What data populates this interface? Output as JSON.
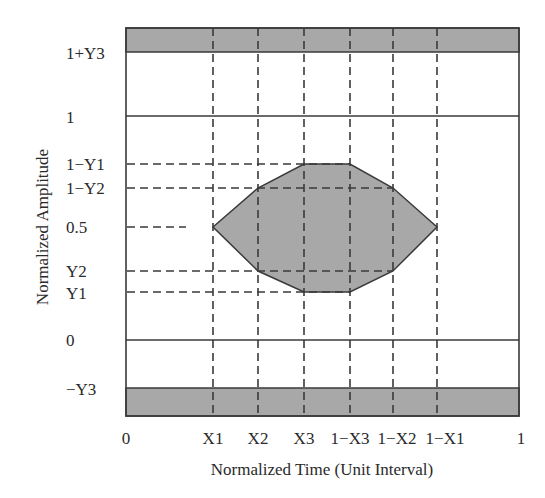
{
  "diagram": {
    "type": "eye-mask",
    "xlabel": "Normalized Time (Unit Interval)",
    "ylabel": "Normalized Amplitude",
    "x_ticks": [
      {
        "label": "0",
        "x": 126
      },
      {
        "label": "X1",
        "x": 213
      },
      {
        "label": "X2",
        "x": 258
      },
      {
        "label": "X3",
        "x": 304
      },
      {
        "label": "1−X3",
        "x": 350
      },
      {
        "label": "1−X2",
        "x": 393
      },
      {
        "label": "1−X1",
        "x": 437
      },
      {
        "label": "1",
        "x": 519
      }
    ],
    "y_ticks": [
      {
        "label": "1+Y3",
        "y": 52
      },
      {
        "label": "1",
        "y": 116
      },
      {
        "label": "1−Y1",
        "y": 164
      },
      {
        "label": "1−Y2",
        "y": 188
      },
      {
        "label": "0.5",
        "y": 227
      },
      {
        "label": "Y2",
        "y": 271
      },
      {
        "label": "Y1",
        "y": 292
      },
      {
        "label": "0",
        "y": 340
      },
      {
        "label": "−Y3",
        "y": 388
      }
    ],
    "colors": {
      "line": "#3a3a3a",
      "fill": "#a8a8a8",
      "background": "#ffffff"
    }
  }
}
